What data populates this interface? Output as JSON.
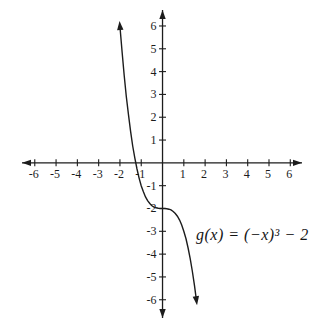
{
  "chart_data": {
    "type": "line",
    "title": "",
    "function_label": "g(x) = (−x)³ − 2",
    "function_expression": "g(x) = (-x)^3 - 2",
    "xlim": [
      -6.6,
      6.55
    ],
    "ylim": [
      -6.8,
      6.7
    ],
    "x_ticks": [
      -6,
      -5,
      -4,
      -3,
      -2,
      -1,
      1,
      2,
      3,
      4,
      5,
      6
    ],
    "y_ticks": [
      -6,
      -5,
      -4,
      -3,
      -2,
      -1,
      1,
      2,
      3,
      4,
      5,
      6
    ],
    "grid": false,
    "legend": "none",
    "axis_color": "#1c1c1c",
    "curve_color": "#1c1c1c",
    "background": "#ffffff",
    "y_intercept": [
      0,
      -2
    ],
    "x_intercept": [
      -1.26,
      0
    ],
    "curve_points": [
      [
        -2.0,
        6.0
      ],
      [
        -1.9,
        4.86
      ],
      [
        -1.8,
        3.83
      ],
      [
        -1.7,
        2.91
      ],
      [
        -1.6,
        2.1
      ],
      [
        -1.5,
        1.38
      ],
      [
        -1.4,
        0.74
      ],
      [
        -1.3,
        0.2
      ],
      [
        -1.2,
        -0.27
      ],
      [
        -1.1,
        -0.67
      ],
      [
        -1.0,
        -1.0
      ],
      [
        -0.9,
        -1.27
      ],
      [
        -0.8,
        -1.49
      ],
      [
        -0.7,
        -1.66
      ],
      [
        -0.6,
        -1.78
      ],
      [
        -0.5,
        -1.88
      ],
      [
        -0.4,
        -1.94
      ],
      [
        -0.3,
        -1.97
      ],
      [
        -0.2,
        -1.99
      ],
      [
        -0.1,
        -2.0
      ],
      [
        0.0,
        -2.0
      ],
      [
        0.1,
        -2.0
      ],
      [
        0.2,
        -2.01
      ],
      [
        0.3,
        -2.03
      ],
      [
        0.4,
        -2.06
      ],
      [
        0.5,
        -2.13
      ],
      [
        0.6,
        -2.22
      ],
      [
        0.7,
        -2.34
      ],
      [
        0.8,
        -2.51
      ],
      [
        0.9,
        -2.73
      ],
      [
        1.0,
        -3.0
      ],
      [
        1.1,
        -3.33
      ],
      [
        1.2,
        -3.73
      ],
      [
        1.3,
        -4.2
      ],
      [
        1.4,
        -4.74
      ],
      [
        1.5,
        -5.38
      ],
      [
        1.59,
        -6.02
      ]
    ]
  }
}
